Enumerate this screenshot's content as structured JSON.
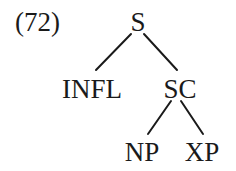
{
  "example": {
    "number": "(72)"
  },
  "tree": {
    "root": "S",
    "nodes": [
      {
        "id": "S",
        "label": "S",
        "x": 138,
        "y": 9
      },
      {
        "id": "INFL",
        "label": "INFL",
        "x": 92,
        "y": 76
      },
      {
        "id": "SC",
        "label": "SC",
        "x": 180,
        "y": 76
      },
      {
        "id": "NP",
        "label": "NP",
        "x": 142,
        "y": 139
      },
      {
        "id": "XP",
        "label": "XP",
        "x": 202,
        "y": 139
      }
    ],
    "edges": [
      {
        "from": "S",
        "to": "INFL"
      },
      {
        "from": "S",
        "to": "SC"
      },
      {
        "from": "SC",
        "to": "NP"
      },
      {
        "from": "SC",
        "to": "XP"
      }
    ]
  },
  "colors": {
    "ink": "#1a1a1a",
    "background": "#ffffff"
  }
}
